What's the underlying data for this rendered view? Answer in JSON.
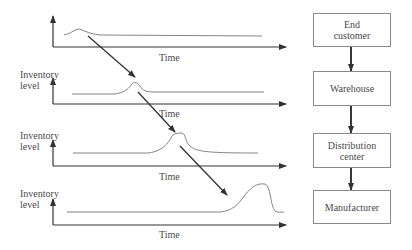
{
  "panels": [
    {
      "y_label": "",
      "x_label": "Time"
    },
    {
      "y_label": "Inventory level",
      "x_label": "Time"
    },
    {
      "y_label": "Inventory level",
      "x_label": "Time"
    },
    {
      "y_label": "Inventory level",
      "x_label": "Time"
    }
  ],
  "chain": [
    {
      "label": "End customer"
    },
    {
      "label": "Warehouse"
    },
    {
      "label": "Distribution center"
    },
    {
      "label": "Manufacturer"
    }
  ],
  "colors": {
    "line": "#3a3a3a",
    "curve": "#6a6a6a",
    "box_border": "#8a8a8a"
  }
}
